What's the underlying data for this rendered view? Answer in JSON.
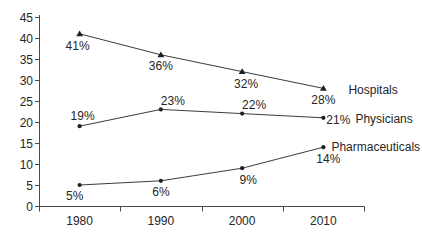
{
  "chart_data": {
    "type": "line",
    "title": "",
    "xlabel": "",
    "ylabel": "",
    "categories": [
      "1980",
      "1990",
      "2000",
      "2010"
    ],
    "series": [
      {
        "name": "Hospitals",
        "marker": "triangle",
        "values": [
          41,
          36,
          32,
          28
        ],
        "point_labels": [
          "41%",
          "36%",
          "32%",
          "28%"
        ],
        "label_offsets": [
          [
            -2,
            16
          ],
          [
            0,
            15
          ],
          [
            4,
            16
          ],
          [
            0,
            16
          ]
        ],
        "name_offset": [
          25,
          6
        ]
      },
      {
        "name": "Physicians",
        "marker": "dot",
        "values": [
          19,
          23,
          22,
          21
        ],
        "point_labels": [
          "19%",
          "23%",
          "22%",
          "21%"
        ],
        "label_offsets": [
          [
            3,
            -6
          ],
          [
            12,
            -4
          ],
          [
            12,
            -5
          ],
          [
            15,
            6
          ]
        ],
        "name_offset": [
          32,
          5
        ]
      },
      {
        "name": "Pharmaceuticals",
        "marker": "dot",
        "values": [
          5,
          6,
          9,
          14
        ],
        "point_labels": [
          "5%",
          "6%",
          "9%",
          "14%"
        ],
        "label_offsets": [
          [
            -5,
            15
          ],
          [
            0,
            15
          ],
          [
            6,
            16
          ],
          [
            5,
            16
          ]
        ],
        "name_offset": [
          8,
          4
        ]
      }
    ],
    "ylim": [
      0,
      45
    ],
    "ytick_step": 5,
    "ytick_labels": [
      "0",
      "5",
      "10",
      "15",
      "20",
      "25",
      "30",
      "35",
      "40",
      "45"
    ],
    "grid": false,
    "legend_position": "right-of-last-point",
    "colors": {
      "line": "#3c3c3c",
      "marker": "#1f1f1f",
      "text": "#262626",
      "axis": "#4a4a4a",
      "background": "#ffffff"
    }
  }
}
